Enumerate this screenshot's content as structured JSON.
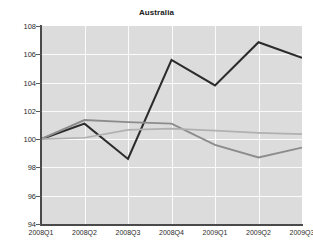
{
  "chart_data": {
    "type": "line",
    "title": "Australia",
    "xlabel": "",
    "ylabel": "",
    "categories": [
      "2008Q1",
      "2008Q2",
      "2008Q3",
      "2008Q4",
      "2009Q1",
      "2009Q2",
      "2009Q3"
    ],
    "ylim": [
      94,
      108
    ],
    "yticks": [
      94,
      96,
      98,
      100,
      102,
      104,
      106,
      108
    ],
    "grid": true,
    "legend": "none",
    "plot_background": "#dcdcdc",
    "series": [
      {
        "name": "series-dark",
        "color": "#2b2b2b",
        "width": 2.1,
        "values": [
          100.0,
          101.1,
          98.6,
          105.6,
          103.8,
          106.85,
          105.75
        ]
      },
      {
        "name": "series-medium-gray",
        "color": "#8c8c8c",
        "width": 1.9,
        "values": [
          100.0,
          101.35,
          101.2,
          101.1,
          99.6,
          98.7,
          99.4
        ]
      },
      {
        "name": "series-light-gray",
        "color": "#b0b0b0",
        "width": 1.7,
        "values": [
          100.0,
          100.1,
          100.65,
          100.75,
          100.6,
          100.45,
          100.35
        ]
      }
    ]
  },
  "axes": {
    "y_tick_labels": [
      "108",
      "106",
      "104",
      "102",
      "100",
      "98",
      "96",
      "94"
    ],
    "x_tick_labels": [
      "2008Q1",
      "2008Q2",
      "2008Q3",
      "2008Q4",
      "2009Q1",
      "2009Q2",
      "2009Q3"
    ]
  }
}
